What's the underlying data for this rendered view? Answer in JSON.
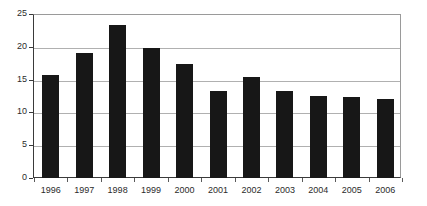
{
  "chart_data": {
    "type": "bar",
    "title": "",
    "subtitle": "",
    "xlabel": "",
    "ylabel": "",
    "categories": [
      "1996",
      "1997",
      "1998",
      "1999",
      "2000",
      "2001",
      "2002",
      "2003",
      "2004",
      "2005",
      "2006"
    ],
    "values": [
      15.7,
      19.1,
      23.3,
      19.8,
      17.4,
      13.3,
      15.4,
      13.2,
      12.5,
      12.4,
      12.0
    ],
    "series": [
      {
        "name": "",
        "values": [
          15.7,
          19.1,
          23.3,
          19.8,
          17.4,
          13.3,
          15.4,
          13.2,
          12.5,
          12.4,
          12.0
        ]
      }
    ],
    "ylim": [
      0,
      25
    ],
    "yticks": [
      0,
      5,
      10,
      15,
      20,
      25
    ],
    "ytick_labels": [
      "0",
      "5",
      "10",
      "15",
      "20",
      "25"
    ],
    "grid": true,
    "grid_axis": "y",
    "legend": false,
    "legend_position": "none",
    "bar_color": "#171717",
    "gridline_color": "#b0b0b0",
    "axis_color": "#3a3a3a",
    "background_color": "#ffffff",
    "annotations": []
  }
}
